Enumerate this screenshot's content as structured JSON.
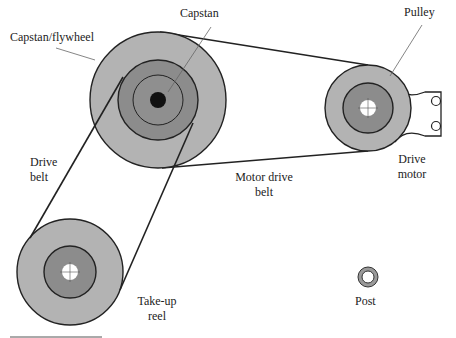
{
  "diagram": {
    "labels": {
      "capstan": "Capstan",
      "flywheel": "Capstan/flywheel",
      "pulley": "Pulley",
      "drive_belt_1": "Drive",
      "drive_belt_2": "belt",
      "motor_belt_1": "Motor drive",
      "motor_belt_2": "belt",
      "drive_motor_1": "Drive",
      "drive_motor_2": "motor",
      "takeup_1": "Take-up",
      "takeup_2": "reel",
      "post": "Post"
    },
    "colors": {
      "light_gray": "#b3b3b3",
      "mid_gray": "#8c8c8c",
      "dark": "#111111",
      "stroke": "#222222"
    }
  }
}
